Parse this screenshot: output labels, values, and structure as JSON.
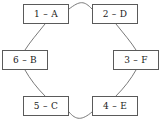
{
  "diagram": {
    "title": "",
    "type": "ring-cycle",
    "style": {
      "background": "#ffffff",
      "node_border": "#5a5a5a",
      "node_fill": "#ffffff",
      "edge_stroke": "#6b6b6b",
      "text_color": "#1a1a1a"
    },
    "nodes": [
      {
        "id": "n1",
        "label": "1 – A",
        "index": "1",
        "letter": "A",
        "position": "top-left"
      },
      {
        "id": "n2",
        "label": "2 – D",
        "index": "2",
        "letter": "D",
        "position": "top-right"
      },
      {
        "id": "n3",
        "label": "3 – F",
        "index": "3",
        "letter": "F",
        "position": "right"
      },
      {
        "id": "n4",
        "label": "4 – E",
        "index": "4",
        "letter": "E",
        "position": "bottom-right"
      },
      {
        "id": "n5",
        "label": "5 – C",
        "index": "5",
        "letter": "C",
        "position": "bottom-left"
      },
      {
        "id": "n6",
        "label": "6 – B",
        "index": "6",
        "letter": "B",
        "position": "left"
      }
    ],
    "edges": [
      {
        "from": "n1",
        "to": "n2",
        "shape": "arc-over-top"
      },
      {
        "from": "n2",
        "to": "n3",
        "shape": "arc-right-upper"
      },
      {
        "from": "n3",
        "to": "n4",
        "shape": "arc-right-lower"
      },
      {
        "from": "n4",
        "to": "n5",
        "shape": "arc-under-bottom"
      },
      {
        "from": "n5",
        "to": "n6",
        "shape": "arc-left-lower"
      },
      {
        "from": "n6",
        "to": "n1",
        "shape": "arc-left-upper"
      }
    ]
  }
}
